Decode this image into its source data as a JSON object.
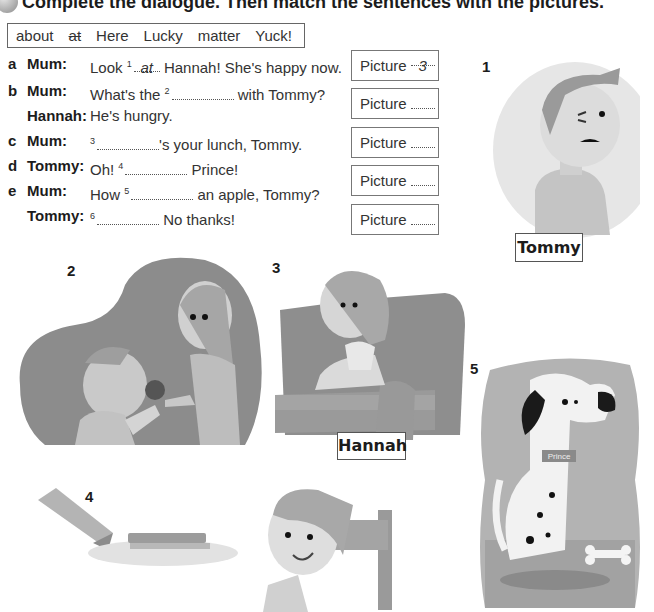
{
  "exercise": {
    "number_icon": "exercise-number-badge",
    "instruction": "Complete the dialogue. Then match the sentences with the pictures."
  },
  "word_bank": [
    {
      "word": "about",
      "crossed": false
    },
    {
      "word": "at",
      "crossed": true
    },
    {
      "word": "Here",
      "crossed": false
    },
    {
      "word": "Lucky",
      "crossed": false
    },
    {
      "word": "matter",
      "crossed": false
    },
    {
      "word": "Yuck!",
      "crossed": false
    }
  ],
  "dialogue": [
    {
      "letter": "a",
      "speaker": "Mum:",
      "before": "Look",
      "gap": "1",
      "answer": "at",
      "after": "Hannah! She's happy now."
    },
    {
      "letter": "b",
      "speaker": "Mum:",
      "before": "What's the",
      "gap": "2",
      "answer": "",
      "after": "with Tommy?"
    },
    {
      "letter": "",
      "speaker": "Hannah:",
      "before": "He's hungry.",
      "gap": "",
      "answer": "",
      "after": ""
    },
    {
      "letter": "c",
      "speaker": "Mum:",
      "before": "",
      "gap": "3",
      "answer": "",
      "after": "'s your lunch, Tommy."
    },
    {
      "letter": "d",
      "speaker": "Tommy:",
      "before": "Oh!",
      "gap": "4",
      "answer": "",
      "after": "Prince!"
    },
    {
      "letter": "e",
      "speaker": "Mum:",
      "before": "How",
      "gap": "5",
      "answer": "",
      "after": "an apple, Tommy?"
    },
    {
      "letter": "",
      "speaker": "Tommy:",
      "before": "",
      "gap": "6",
      "answer": "",
      "after": "No thanks!"
    }
  ],
  "picture_boxes": [
    {
      "label": "Picture",
      "answer": "3"
    },
    {
      "label": "Picture",
      "answer": ""
    },
    {
      "label": "Picture",
      "answer": ""
    },
    {
      "label": "Picture",
      "answer": ""
    },
    {
      "label": "Picture",
      "answer": ""
    }
  ],
  "pictures": [
    {
      "number": "1",
      "name_label": "Tommy",
      "description": "worried boy"
    },
    {
      "number": "2",
      "name_label": "",
      "description": "Mum offering apple to boy"
    },
    {
      "number": "3",
      "name_label": "Hannah",
      "description": "girl in armchair with ice cream"
    },
    {
      "number": "4",
      "name_label": "",
      "description": "hand offering sandwich to boy"
    },
    {
      "number": "5",
      "name_label": "",
      "description": "dalmatian dog with bone",
      "collar_tag": "Prince"
    }
  ],
  "colors": {
    "text": "#333333",
    "border": "#666666",
    "illustration_dark": "#8c8c8c",
    "illustration_mid": "#b0b0b0",
    "illustration_light": "#d6d6d6"
  }
}
